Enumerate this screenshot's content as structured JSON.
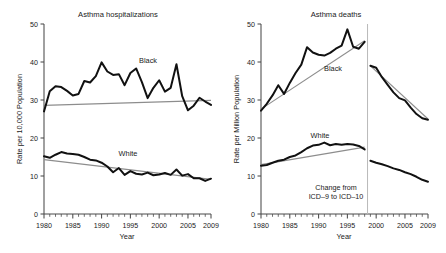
{
  "figure": {
    "panels": [
      {
        "id": "asthma-hospitalizations",
        "title": "Asthma hospitalizations",
        "ylabel": "Rate per 10,000 Population",
        "xlabel": "Year"
      },
      {
        "id": "asthma-deaths",
        "title": "Asthma deaths",
        "ylabel": "Rate per Million Population",
        "xlabel": "Year"
      }
    ]
  },
  "labels": {
    "black": "Black",
    "white": "White",
    "note_line1": "Change from",
    "note_line2": "ICD–9 to ICD–10"
  },
  "axes": {
    "y_ticks": [
      "0",
      "10",
      "20",
      "30",
      "40",
      "50"
    ],
    "y_tick_values": [
      0,
      10,
      20,
      30,
      40,
      50
    ],
    "x_ticks": [
      "1980",
      "1985",
      "1990",
      "1995",
      "2000",
      "2005",
      "2009"
    ],
    "x_tick_values": [
      1980,
      1985,
      1990,
      1995,
      2000,
      2005,
      2009
    ],
    "xlim": [
      1980,
      2009
    ],
    "ylim": [
      0,
      50
    ]
  },
  "colors": {
    "data_line": "#111111",
    "trend_line": "#8d8d8d",
    "axis": "#4a4a4a",
    "break_marker": "#b9b9b9",
    "background": "#ffffff"
  },
  "chart_data": [
    {
      "type": "line",
      "title": "Asthma hospitalizations",
      "xlabel": "Year",
      "ylabel": "Rate per 10,000 Population",
      "xlim": [
        1980,
        2009
      ],
      "ylim": [
        0,
        50
      ],
      "grid": false,
      "legend": "inline-annotations",
      "x": [
        1980,
        1981,
        1982,
        1983,
        1984,
        1985,
        1986,
        1987,
        1988,
        1989,
        1990,
        1991,
        1992,
        1993,
        1994,
        1995,
        1996,
        1997,
        1998,
        1999,
        2000,
        2001,
        2002,
        2003,
        2004,
        2005,
        2006,
        2007,
        2008,
        2009
      ],
      "series": [
        {
          "name": "Black",
          "values": [
            27.0,
            32.3,
            33.6,
            33.4,
            32.4,
            31.2,
            31.6,
            35.0,
            34.6,
            36.3,
            39.9,
            37.5,
            36.6,
            36.8,
            33.9,
            37.1,
            38.3,
            34.7,
            30.5,
            33.2,
            35.2,
            32.2,
            33.2,
            39.4,
            31.0,
            27.3,
            28.5,
            30.6,
            29.6,
            28.7
          ],
          "trend": {
            "start_year": 1980,
            "end_year": 2009,
            "start_value": 28.6,
            "end_value": 29.9
          }
        },
        {
          "name": "White",
          "values": [
            15.2,
            14.8,
            15.6,
            16.3,
            15.9,
            15.8,
            15.6,
            15.0,
            14.3,
            14.1,
            13.5,
            12.5,
            11.0,
            12.1,
            10.3,
            11.3,
            10.6,
            10.4,
            10.9,
            10.2,
            10.4,
            10.8,
            10.3,
            11.7,
            10.1,
            10.5,
            9.4,
            9.4,
            8.7,
            9.3
          ],
          "trend": {
            "start_year": 1980,
            "end_year": 2009,
            "start_value": 14.3,
            "end_value": 9.1
          }
        }
      ]
    },
    {
      "type": "line",
      "title": "Asthma deaths",
      "xlabel": "Year",
      "ylabel": "Rate per Million Population",
      "xlim": [
        1980,
        2009
      ],
      "ylim": [
        0,
        50
      ],
      "grid": false,
      "legend": "inline-annotations",
      "annotation": "Change from ICD-9 to ICD-10",
      "annotation_x": 1998.5,
      "segments": [
        {
          "name": "ICD-9",
          "x": [
            1980,
            1981,
            1982,
            1983,
            1984,
            1985,
            1986,
            1987,
            1988,
            1989,
            1990,
            1991,
            1992,
            1993,
            1994,
            1995,
            1996,
            1997,
            1998
          ],
          "series": [
            {
              "name": "Black",
              "values": [
                27.2,
                29.0,
                31.2,
                33.9,
                31.6,
                34.5,
                37.1,
                39.3,
                43.9,
                42.5,
                41.9,
                41.7,
                42.4,
                43.5,
                44.3,
                48.6,
                44.0,
                43.5,
                45.3
              ],
              "trend": {
                "start_year": 1980,
                "end_year": 1998,
                "start_value": 27.6,
                "end_value": 45.6
              }
            },
            {
              "name": "White",
              "values": [
                12.7,
                12.9,
                13.5,
                14.0,
                14.3,
                15.0,
                15.4,
                16.3,
                17.3,
                18.0,
                18.2,
                18.8,
                18.1,
                18.4,
                18.2,
                18.4,
                18.3,
                17.9,
                17.0
              ],
              "trend": {
                "start_year": 1980,
                "end_year": 1998,
                "start_value": 13.0,
                "end_value": 17.6
              }
            }
          ]
        },
        {
          "name": "ICD-10",
          "x": [
            1999,
            2000,
            2001,
            2002,
            2003,
            2004,
            2005,
            2006,
            2007,
            2008,
            2009
          ],
          "series": [
            {
              "name": "Black",
              "values": [
                39.0,
                38.5,
                36.0,
                34.0,
                32.0,
                30.5,
                29.9,
                28.0,
                26.3,
                25.2,
                24.8
              ],
              "trend": {
                "start_year": 1999,
                "end_year": 2009,
                "start_value": 39.0,
                "end_value": 25.0
              }
            },
            {
              "name": "White",
              "values": [
                14.0,
                13.5,
                13.1,
                12.6,
                12.0,
                11.6,
                11.0,
                10.5,
                9.8,
                9.0,
                8.5
              ],
              "trend": null
            }
          ]
        }
      ]
    }
  ]
}
